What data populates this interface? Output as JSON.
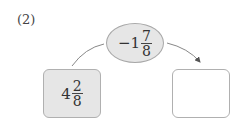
{
  "problem_label": "(2)",
  "operator": {
    "sign": "−",
    "whole": "1",
    "numerator": "7",
    "denominator": "8"
  },
  "start_value": {
    "whole": "4",
    "numerator": "2",
    "denominator": "8"
  },
  "answer_box": {
    "value": ""
  },
  "colors": {
    "shape_fill": "#e6e6e6",
    "border": "#a8a8a8",
    "text": "#333333"
  }
}
